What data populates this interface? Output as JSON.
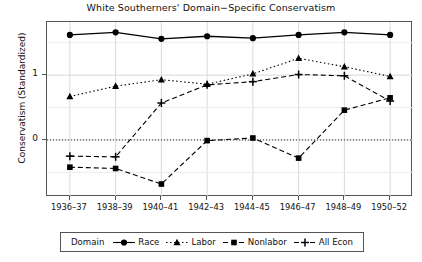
{
  "chart_data": {
    "type": "line",
    "title": "White Southerners' Domain−Specific Conservatism",
    "xlabel": "",
    "ylabel": "Conservatism (Standardized)",
    "categories": [
      "1936–37",
      "1938–39",
      "1940–41",
      "1942–43",
      "1944–45",
      "1946–47",
      "1948–49",
      "1950–52"
    ],
    "yticks": [
      0,
      1
    ],
    "ytick_labels": [
      "0",
      "1"
    ],
    "ylim": [
      -0.88,
      1.82
    ],
    "grid": true,
    "zero_reference_line": 0,
    "legend_position": "below",
    "legend_title": "Domain",
    "series": [
      {
        "name": "Race",
        "marker": "circle",
        "linestyle": "solid",
        "color": "#000000",
        "values": [
          1.62,
          1.66,
          1.56,
          1.6,
          1.57,
          1.62,
          1.66,
          1.62
        ]
      },
      {
        "name": "Labor",
        "marker": "triangle",
        "linestyle": "dotted",
        "color": "#000000",
        "values": [
          0.67,
          0.83,
          0.93,
          0.86,
          1.02,
          1.26,
          1.13,
          0.98
        ]
      },
      {
        "name": "Nonlabor",
        "marker": "square",
        "linestyle": "dashed",
        "color": "#000000",
        "values": [
          -0.42,
          -0.44,
          -0.68,
          -0.01,
          0.03,
          -0.28,
          0.46,
          0.65
        ]
      },
      {
        "name": "All Econ",
        "marker": "plus",
        "linestyle": "dashed",
        "color": "#000000",
        "values": [
          -0.25,
          -0.26,
          0.57,
          0.85,
          0.9,
          1.01,
          0.99,
          0.6
        ]
      }
    ]
  }
}
